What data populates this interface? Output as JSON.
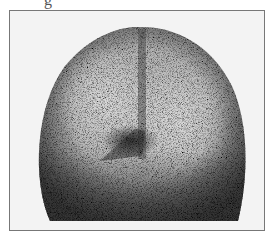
{
  "figure": {
    "caption_fragment": "g",
    "image_description": "Grayscale nuclear-medicine (scintigraphy) anterior head scan with speckled noise texture",
    "colors": {
      "background": "#f3f3f3",
      "frame": "#777777",
      "dark_uptake": "#2a2a2a",
      "light_region": "#cfcfcf"
    }
  }
}
